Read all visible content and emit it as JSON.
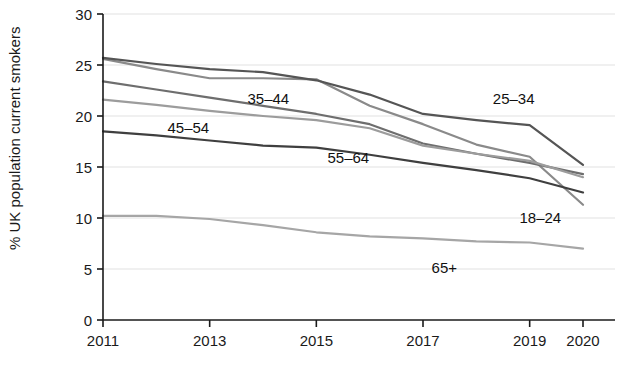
{
  "chart_data": {
    "type": "line",
    "title": "",
    "subtitle": "",
    "xlabel": "",
    "ylabel": "% UK population current smokers",
    "x": [
      2011,
      2012,
      2013,
      2014,
      2015,
      2016,
      2017,
      2018,
      2019,
      2020
    ],
    "xtick_labels": [
      "2011",
      "2013",
      "2015",
      "2017",
      "2019",
      "2020"
    ],
    "xtick_values": [
      2011,
      2013,
      2015,
      2017,
      2019,
      2020
    ],
    "ytick_labels": [
      "0",
      "5",
      "10",
      "15",
      "20",
      "25",
      "30"
    ],
    "ytick_values": [
      0,
      5,
      10,
      15,
      20,
      25,
      30
    ],
    "xlim": [
      2011,
      2020
    ],
    "ylim": [
      0,
      30
    ],
    "grid": "horizontal",
    "legend": "inline-annotations",
    "series": [
      {
        "name": "18–24",
        "color": "#8a8a8a",
        "label_x": 2019.2,
        "label_y": 9.5,
        "values": [
          25.6,
          24.6,
          23.7,
          23.7,
          23.6,
          21.0,
          19.2,
          17.2,
          16.0,
          11.3
        ]
      },
      {
        "name": "25–34",
        "color": "#555555",
        "label_x": 2018.7,
        "label_y": 21.2,
        "values": [
          25.7,
          25.1,
          24.6,
          24.3,
          23.5,
          22.1,
          20.2,
          19.6,
          19.1,
          15.2
        ]
      },
      {
        "name": "35–44",
        "color": "#6e6e6e",
        "label_x": 2014.1,
        "label_y": 21.2,
        "values": [
          23.4,
          22.6,
          21.8,
          21.0,
          20.2,
          19.2,
          17.3,
          16.3,
          15.4,
          14.3
        ]
      },
      {
        "name": "45–54",
        "color": "#9c9c9c",
        "label_x": 2012.6,
        "label_y": 18.3,
        "values": [
          21.6,
          21.1,
          20.5,
          20.0,
          19.6,
          18.8,
          17.1,
          16.3,
          15.6,
          14.0
        ]
      },
      {
        "name": "55–64",
        "color": "#3f3f3f",
        "label_x": 2015.6,
        "label_y": 15.4,
        "values": [
          18.5,
          18.1,
          17.6,
          17.1,
          16.9,
          16.2,
          15.4,
          14.7,
          13.9,
          12.5
        ]
      },
      {
        "name": "65+",
        "color": "#a6a6a6",
        "label_x": 2017.4,
        "label_y": 4.6,
        "values": [
          10.2,
          10.2,
          9.9,
          9.3,
          8.6,
          8.2,
          8.0,
          7.7,
          7.6,
          7.0
        ]
      }
    ]
  },
  "axes": {
    "y_axis_title": "% UK population current smokers"
  }
}
